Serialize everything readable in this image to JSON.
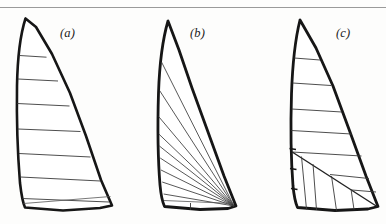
{
  "figure": {
    "background_color": "#fdfdfc",
    "ink_color": "#161616",
    "seam_color": "#3a3a3a",
    "rule_color": "#9a9a9a",
    "width": 386,
    "height": 224,
    "top_rule": {
      "y": 7.5,
      "x1": 0,
      "x2": 386,
      "thickness": 1
    }
  },
  "labels": {
    "a": "(a)",
    "b": "(b)",
    "c": "(c)"
  },
  "sails": [
    {
      "key": "a",
      "label": "(a)",
      "cut": "cross-cut",
      "outline": "M 25.5,18.5 C 20.5,34 17.5,58 17,86 C 16.5,118 17.5,152 20,183 C 21.5,196 23,203 25,207.5 L 63,210.5 L 100,208 L 112,205.5 L 101,180 L 86,136 L 70,93 L 52,54 L 36,27 Z",
      "seams": [
        "M 19.6,55.5 L 46.5,57.2",
        "M 18.0,79.0 L 58.0,81.0",
        "M 17.2,103.5 L 69.5,106.0",
        "M 17.8,129.0 L 80.5,131.5",
        "M 19.0,153.5 L 90.5,157.0",
        "M 20.4,177.0 L 100.5,181.0",
        "M 22.5,198.5 L 109.0,202.0"
      ],
      "extra_seams": [
        "M 23.5,203.5 L 110.5,196.5"
      ]
    },
    {
      "key": "b",
      "label": "(b)",
      "cut": "radial / mitre-radial",
      "outline": "M 168.0,21.0 C 163.0,38 159.5,64 158.5,93 C 157.5,126 158.0,160 160.0,185 C 161.0,196 162.5,202 164.5,206.5 L 200,209.5 L 228,208.5 L 236.0,206.0 L 224.0,176.0 L 208.0,132.0 L 192.0,88.0 L 179.0,50.0 Z",
      "radial_lines": [
        "M 161.5,62.0 L 234.0,206.0",
        "M 159.6,90.5 L 234.0,206.0",
        "M 158.6,116.5 L 234.0,206.0",
        "M 158.8,134.0 L 234.0,206.0",
        "M 159.4,146.0 L 234.0,206.0",
        "M 160.2,158.0 L 234.0,206.0",
        "M 161.0,170.0 L 234.0,206.0",
        "M 162.2,182.0 L 234.0,206.0",
        "M 163.6,194.0 L 234.0,206.0"
      ],
      "foot_seams": [
        "M 164.0,200.5 L 234.0,203.5"
      ],
      "batten_marks": [
        "M 190.5,203.0 L 190.5,210.0"
      ]
    },
    {
      "key": "c",
      "label": "(c)",
      "cut": "mitre-cut",
      "outline": "M 300.0,20.0 C 295.5,38 292.5,64 291.5,94 C 290.5,126 291.0,160 293.0,186 C 294.0,196 295.5,203 297.5,207.5 L 335,210.5 L 368,209.0 L 378.0,206.5 L 366.0,176.0 L 350.0,132.0 L 333.0,86.0 L 316.0,48.0 Z",
      "horizontal_seams": [
        "M 294.2,58.0 L 320.0,60.0",
        "M 292.6,83.0 L 331.0,85.5",
        "M 291.6,109.0 L 342.0,112.0",
        "M 291.4,130.5 L 351.5,134.0",
        "M 292.0,152.0 L 361.5,156.0"
      ],
      "mitre_line": "M 292.2,152.0 L 377.0,206.5",
      "lower_seams": [
        "M 301.5,156.5 L 306.5,209.5",
        "M 313.0,164.0 L 316.5,210.0",
        "M 331.5,176.0 L 336.5,210.5",
        "M 351.0,189.0 L 354.0,209.5",
        "M 330.0,174.5 L 369.0,178.5",
        "M 352.0,190.0 L 376.0,192.0"
      ],
      "luff_ticks": [
        "M 289.5,148.5 L 296.0,149.5",
        "M 290.0,168.5 L 296.5,169.5",
        "M 291.0,188.5 L 297.5,189.5"
      ]
    }
  ]
}
